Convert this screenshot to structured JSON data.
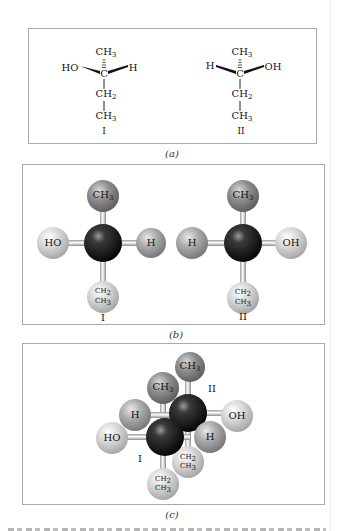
{
  "figure": {
    "panels": [
      {
        "id": "a",
        "caption": "(a)",
        "style": "wedge-dash structural formula",
        "molecules": [
          {
            "label": "I",
            "top": "CH3",
            "left": "HO",
            "center": "C",
            "right": "H",
            "chain": [
              "CH2",
              "CH3"
            ]
          },
          {
            "label": "II",
            "top": "CH3",
            "left": "H",
            "center": "C",
            "right": "OH",
            "chain": [
              "CH2",
              "CH3"
            ]
          }
        ]
      },
      {
        "id": "b",
        "caption": "(b)",
        "style": "ball-and-stick model",
        "molecules": [
          {
            "label": "I",
            "top": "CH3",
            "left": "HO",
            "right": "H",
            "bottom_1": "CH2",
            "bottom_2": "CH3"
          },
          {
            "label": "II",
            "top": "CH3",
            "left": "H",
            "right": "OH",
            "bottom_1": "CH2",
            "bottom_2": "CH3"
          }
        ]
      },
      {
        "id": "c",
        "caption": "(c)",
        "style": "superimposed ball-and-stick models",
        "molecules": [
          {
            "label": "I",
            "top": "CH3",
            "left": "HO",
            "upper_left": "H",
            "bottom_1": "CH2",
            "bottom_2": "CH3"
          },
          {
            "label": "II",
            "top": "CH3",
            "right": "OH",
            "lower_right": "H",
            "bottom_1": "CH2",
            "bottom_2": "CH3"
          }
        ]
      }
    ],
    "colors": {
      "carbon": "#111111",
      "methyl": "#8c8c8c",
      "hydrogen": "#a6a6a6",
      "hydroxyl": "#d2d2d2",
      "ethyl": "#cfcfcf",
      "bond": "#e6e6e6",
      "border": "#a9a9a9"
    }
  }
}
